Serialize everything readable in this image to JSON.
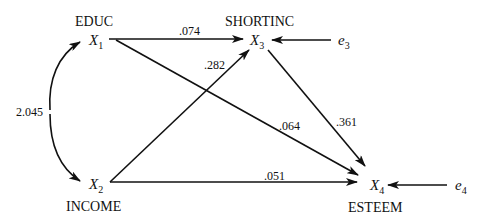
{
  "nodes": {
    "x1": {
      "name": "EDUC",
      "symbol": "X",
      "index": "1"
    },
    "x2": {
      "name": "INCOME",
      "symbol": "X",
      "index": "2"
    },
    "x3": {
      "name": "SHORTINC",
      "symbol": "X",
      "index": "3"
    },
    "x4": {
      "name": "ESTEEM",
      "symbol": "X",
      "index": "4"
    },
    "e3": {
      "symbol": "e",
      "index": "3"
    },
    "e4": {
      "symbol": "e",
      "index": "4"
    }
  },
  "edges": {
    "x1_x3": {
      "from": "X1",
      "to": "X3",
      "coefficient": ".074"
    },
    "x2_x3": {
      "from": "X2",
      "to": "X3",
      "coefficient": ".282"
    },
    "x1_x4": {
      "from": "X1",
      "to": "X4",
      "coefficient": ".064"
    },
    "x3_x4": {
      "from": "X3",
      "to": "X4",
      "coefficient": ".361"
    },
    "x2_x4": {
      "from": "X2",
      "to": "X4",
      "coefficient": ".051"
    },
    "x1_x2": {
      "from": "X1",
      "to": "X2",
      "type": "covariance",
      "coefficient": "2.045"
    },
    "e3_x3": {
      "from": "e3",
      "to": "X3"
    },
    "e4_x4": {
      "from": "e4",
      "to": "X4"
    }
  }
}
